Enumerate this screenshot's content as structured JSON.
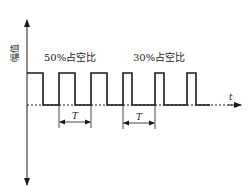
{
  "diagram": {
    "y_axis_label": "幅值",
    "x_axis_label": "t",
    "section_labels": [
      {
        "text": "50%占空比"
      },
      {
        "text": "30%占空比"
      }
    ],
    "period_labels": [
      {
        "text": "T"
      },
      {
        "text": "T"
      }
    ],
    "colors": {
      "line": "#1a1a1a",
      "background": "#ffffff"
    }
  }
}
